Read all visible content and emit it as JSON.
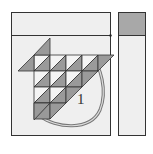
{
  "diagram": {
    "type": "quilt-block-layout",
    "block_label": "1",
    "colors": {
      "background": "#ffffff",
      "panel_fill": "#eeeeee",
      "outline": "#333333",
      "shaded": "#9a9a9a",
      "light": "#f4f4f4",
      "curve": "#888888",
      "header_shaded": "#a8a8a8"
    },
    "panels": [
      {
        "name": "main-panel",
        "has_header": true,
        "header_shaded": false
      },
      {
        "name": "side-panel",
        "has_header": true,
        "header_shaded": true
      }
    ],
    "grid": {
      "rows": 4,
      "cols": 4
    }
  }
}
